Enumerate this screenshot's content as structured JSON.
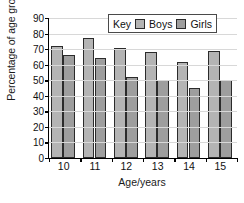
{
  "chart_data": {
    "type": "bar",
    "title": "",
    "xlabel": "Age/years",
    "ylabel": "Percentage of age group",
    "categories": [
      "10",
      "11",
      "12",
      "13",
      "14",
      "15"
    ],
    "series": [
      {
        "name": "Boys",
        "values": [
          72,
          77,
          71,
          68,
          62,
          69
        ],
        "color": "#b4b4b4"
      },
      {
        "name": "Girls",
        "values": [
          66,
          64,
          52,
          50,
          45,
          50
        ],
        "color": "#9e9e9e"
      }
    ],
    "ylim": [
      0,
      90
    ],
    "ytick_step": 10,
    "yticks": [
      0,
      10,
      20,
      30,
      40,
      50,
      60,
      70,
      80,
      90
    ],
    "grid": true,
    "legend_position": "top-center-right",
    "legend": {
      "key_label": "Key",
      "entries": [
        "Boys",
        "Girls"
      ]
    }
  },
  "axes": {
    "y_label": "Percentage of age group",
    "x_label": "Age/years"
  }
}
